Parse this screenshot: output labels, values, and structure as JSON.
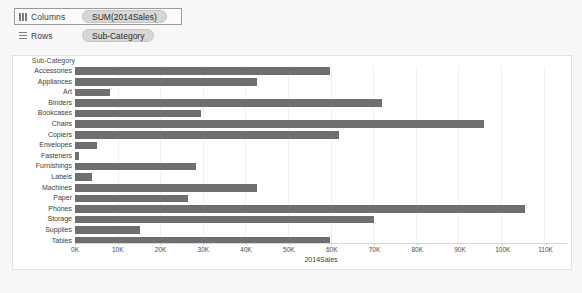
{
  "shelves": {
    "columns": {
      "label": "Columns",
      "icon": "columns-grid-icon",
      "pill": "SUM(2014Sales)"
    },
    "rows": {
      "label": "Rows",
      "icon": "rows-grid-icon",
      "pill": "Sub-Category"
    }
  },
  "chart_data": {
    "type": "bar",
    "orientation": "horizontal",
    "title": "",
    "xlabel": "2014Sales",
    "ylabel": "Sub-Category",
    "corner_label": "Sub-Category",
    "xlim": [
      0,
      115000
    ],
    "xticks": [
      0,
      10000,
      20000,
      30000,
      40000,
      50000,
      60000,
      70000,
      80000,
      90000,
      100000,
      110000
    ],
    "xtick_labels": [
      "0K",
      "10K",
      "20K",
      "30K",
      "40K",
      "50K",
      "60K",
      "70K",
      "80K",
      "90K",
      "100K",
      "110K"
    ],
    "grid": true,
    "legend": "none",
    "bar_color": "#6f6f6f",
    "categories": [
      "Accessories",
      "Appliances",
      "Art",
      "Binders",
      "Bookcases",
      "Chairs",
      "Copiers",
      "Envelopes",
      "Fasteners",
      "Furnishings",
      "Labels",
      "Machines",
      "Paper",
      "Phones",
      "Storage",
      "Supplies",
      "Tables"
    ],
    "values": [
      59000,
      42000,
      8000,
      71000,
      29000,
      94500,
      61000,
      5000,
      1000,
      28000,
      4000,
      42000,
      26000,
      104000,
      69000,
      15000,
      59000
    ]
  }
}
